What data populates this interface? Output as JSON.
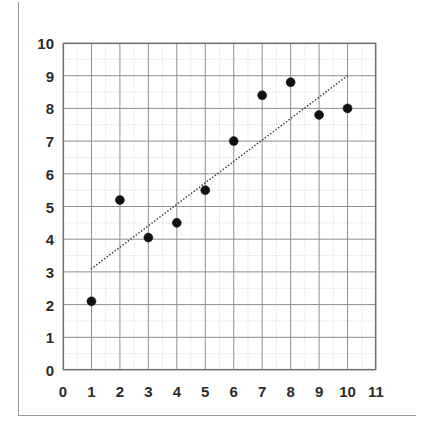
{
  "chart_data": {
    "type": "scatter",
    "title": "",
    "subtitle": "",
    "xlabel": "",
    "ylabel": "",
    "xlim": [
      0,
      11
    ],
    "ylim": [
      0,
      10
    ],
    "x_ticks": [
      0,
      1,
      2,
      3,
      4,
      5,
      6,
      7,
      8,
      9,
      10,
      11
    ],
    "y_ticks": [
      0,
      1,
      2,
      3,
      4,
      5,
      6,
      7,
      8,
      9,
      10
    ],
    "x_tick_labels": [
      "0",
      "1",
      "2",
      "3",
      "4",
      "5",
      "6",
      "7",
      "8",
      "9",
      "10",
      "11"
    ],
    "y_tick_labels": [
      "0",
      "1",
      "2",
      "3",
      "4",
      "5",
      "6",
      "7",
      "8",
      "9",
      "10"
    ],
    "grid": true,
    "grid_major_step": 1,
    "grid_minor_step": 0.5,
    "legend": false,
    "legend_position": "none",
    "series": [
      {
        "name": "data-points",
        "type": "scatter",
        "marker": "filled-circle",
        "color": "#111111",
        "marker_size": 9,
        "x": [
          1,
          2,
          3,
          4,
          5,
          6,
          7,
          8,
          9,
          10
        ],
        "y": [
          2.1,
          5.2,
          4.05,
          4.5,
          5.5,
          7.0,
          8.4,
          8.8,
          7.8,
          8.0
        ],
        "points": [
          {
            "x": 1,
            "y": 2.1
          },
          {
            "x": 2,
            "y": 5.2
          },
          {
            "x": 3,
            "y": 4.05
          },
          {
            "x": 4,
            "y": 4.5
          },
          {
            "x": 5,
            "y": 5.5
          },
          {
            "x": 6,
            "y": 7.0
          },
          {
            "x": 7,
            "y": 8.4
          },
          {
            "x": 8,
            "y": 8.8
          },
          {
            "x": 9,
            "y": 7.8
          },
          {
            "x": 10,
            "y": 8.0
          }
        ]
      },
      {
        "name": "trend-line",
        "type": "line",
        "style": "dotted",
        "color": "#3a3a3a",
        "width": 1.6,
        "x": [
          1,
          10
        ],
        "y": [
          3.1,
          9.0
        ],
        "points": [
          {
            "x": 1,
            "y": 3.1
          },
          {
            "x": 10,
            "y": 9.0
          }
        ]
      }
    ]
  },
  "style": {
    "background": "#ffffff",
    "grid_major_color": "#8f8f8f",
    "grid_minor_color": "#c9c9c9",
    "axis_color": "#6f6f6f",
    "tick_label_color": "#2b2b2b",
    "marker_color": "#111111",
    "trend_color": "#3a3a3a",
    "frame_color": "#9a9a9a"
  }
}
